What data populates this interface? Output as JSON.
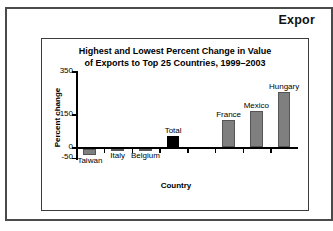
{
  "header": {
    "title": "Expor"
  },
  "chart_data": {
    "type": "bar",
    "title_line1": "Highest and Lowest Percent Change in Value",
    "title_line2": "of Exports to Top 25 Countries, 1999–2003",
    "title": "Highest and Lowest Percent Change in Value of Exports to Top 25 Countries, 1999–2003",
    "xlabel": "Country",
    "ylabel": "Percent change",
    "ylim": [
      -50,
      350
    ],
    "yticks": [
      350,
      150,
      0,
      -50
    ],
    "ytick_labels": [
      "350",
      "150",
      "0",
      "-50"
    ],
    "grid": false,
    "legend": "none",
    "categories": [
      "Taiwan",
      "Italy",
      "Belgium",
      "Total",
      "France",
      "Mexico",
      "Hungary"
    ],
    "values": [
      -30,
      -10,
      -10,
      50,
      125,
      165,
      255
    ],
    "bar_colors": [
      "#7f7f7f",
      "#7f7f7f",
      "#7f7f7f",
      "#000000",
      "#7f7f7f",
      "#7f7f7f",
      "#7f7f7f"
    ],
    "bars": [
      {
        "label": "Taiwan",
        "value": -30,
        "color": "#7f7f7f"
      },
      {
        "label": "Italy",
        "value": -10,
        "color": "#7f7f7f"
      },
      {
        "label": "Belgium",
        "value": -10,
        "color": "#7f7f7f"
      },
      {
        "label": "Total",
        "value": 50,
        "color": "#000000"
      },
      {
        "label": "France",
        "value": 125,
        "color": "#7f7f7f"
      },
      {
        "label": "Mexico",
        "value": 165,
        "color": "#7f7f7f"
      },
      {
        "label": "Hungary",
        "value": 255,
        "color": "#7f7f7f"
      }
    ]
  }
}
